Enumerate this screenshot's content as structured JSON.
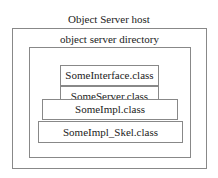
{
  "host": {
    "label": "Object Server host"
  },
  "directory": {
    "label": "object server directory"
  },
  "files": [
    {
      "name": "SomeInterface.class"
    },
    {
      "name": "SomeServer.class"
    },
    {
      "name": "SomeImpl.class"
    },
    {
      "name": "SomeImpl_Skel.class"
    }
  ]
}
